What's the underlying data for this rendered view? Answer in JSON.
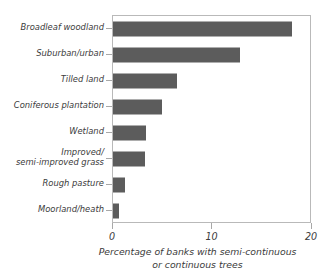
{
  "chart_data": {
    "type": "bar",
    "orientation": "horizontal",
    "title": "",
    "subtitle": "",
    "xlabel": "Percentage of banks with semi-continuous\nor continuous trees",
    "ylabel": "",
    "xlim": [
      0,
      20
    ],
    "xticks": [
      0,
      10,
      20
    ],
    "xtick_labels": [
      "0",
      "10",
      "20"
    ],
    "grid": false,
    "legend": false,
    "bar_color": "#5c5c5c",
    "frame_color": "#b9b9b9",
    "categories": [
      "Broadleaf woodland",
      "Suburban/urban",
      "Tilled land",
      "Coniferous plantation",
      "Wetland",
      "Improved/\nsemi-improved grass",
      "Rough pasture",
      "Moorland/heath"
    ],
    "values": [
      18.0,
      12.8,
      6.4,
      4.9,
      3.3,
      3.2,
      1.2,
      0.6
    ]
  },
  "axis": {
    "caption": "Percentage of banks with semi-continuous\nor continuous trees",
    "tick_0": "0",
    "tick_10": "10",
    "tick_20": "20"
  },
  "categories": {
    "c0": "Broadleaf woodland",
    "c1": "Suburban/urban",
    "c2": "Tilled land",
    "c3": "Coniferous plantation",
    "c4": "Wetland",
    "c5": "Improved/\nsemi-improved grass",
    "c6": "Rough pasture",
    "c7": "Moorland/heath"
  }
}
